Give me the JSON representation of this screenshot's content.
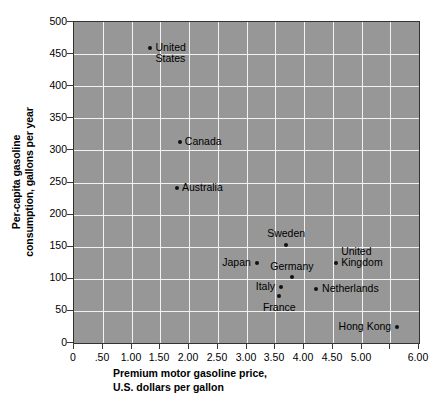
{
  "chart_data": {
    "type": "scatter",
    "title": "",
    "xlabel": "Premium motor gasoline price,\nU.S. dollars per gallon",
    "xlabel_line1": "Premium motor gasoline price,",
    "xlabel_line2": "U.S. dollars per gallon",
    "ylabel": "Per-capita gasoline\nconsumption, gallons per year",
    "ylabel_line1": "Per-capita gasoline",
    "ylabel_line2": "consumption, gallons per year",
    "xlim": [
      0,
      6.0
    ],
    "ylim": [
      0,
      500
    ],
    "xticks": [
      0,
      0.5,
      1.0,
      1.5,
      2.0,
      2.5,
      3.0,
      3.5,
      4.0,
      4.5,
      5.0,
      6.0
    ],
    "xtick_labels": [
      "0",
      ".50",
      "1.00",
      "1.50",
      "2.00",
      "2.50",
      "3.00",
      "3.50",
      "4.00",
      "4.50",
      "5.00",
      "6.00"
    ],
    "xticks_plot": [
      0,
      0.5,
      1.0,
      1.5,
      2.0,
      2.5,
      3.0,
      3.5,
      4.0,
      4.5,
      5.0,
      5.5,
      6.0
    ],
    "yticks": [
      0,
      50,
      100,
      150,
      200,
      250,
      300,
      350,
      400,
      450,
      500
    ],
    "ytick_labels": [
      "0",
      "50",
      "100",
      "150",
      "200",
      "250",
      "300",
      "350",
      "400",
      "450",
      "500"
    ],
    "grid": true,
    "grid_color": "#f2f2f2",
    "plot_background": "#979797",
    "marker_color": "#111111",
    "legend": "none",
    "points": [
      {
        "name": "United States",
        "label_line1": "United",
        "label_line2": "States",
        "x": 1.33,
        "y": 460,
        "label_side": "right",
        "label_dx": 5,
        "label_dy": -6
      },
      {
        "name": "Canada",
        "label_line1": "Canada",
        "label_line2": "",
        "x": 1.84,
        "y": 313,
        "label_side": "right",
        "label_dx": 5,
        "label_dy": -6
      },
      {
        "name": "Australia",
        "label_line1": "Australia",
        "label_line2": "",
        "x": 1.79,
        "y": 241,
        "label_side": "right",
        "label_dx": 5,
        "label_dy": -6
      },
      {
        "name": "Sweden",
        "label_line1": "Sweden",
        "label_line2": "",
        "x": 3.69,
        "y": 153,
        "label_side": "center-above",
        "label_dx": 0,
        "label_dy": -17
      },
      {
        "name": "Japan",
        "label_line1": "Japan",
        "label_line2": "",
        "x": 3.18,
        "y": 125,
        "label_side": "left",
        "label_dx": -6,
        "label_dy": -6
      },
      {
        "name": "Germany",
        "label_line1": "Germany",
        "label_line2": "",
        "x": 3.79,
        "y": 103,
        "label_side": "center-above",
        "label_dx": 0,
        "label_dy": -16
      },
      {
        "name": "Italy",
        "label_line1": "Italy",
        "label_line2": "",
        "x": 3.6,
        "y": 87,
        "label_side": "left",
        "label_dx": -6,
        "label_dy": -6
      },
      {
        "name": "France",
        "label_line1": "France",
        "label_line2": "",
        "x": 3.57,
        "y": 73,
        "label_side": "center-below",
        "label_dx": 0,
        "label_dy": 6
      },
      {
        "name": "Netherlands",
        "label_line1": "Netherlands",
        "label_line2": "",
        "x": 4.21,
        "y": 84,
        "label_side": "right",
        "label_dx": 6,
        "label_dy": -6
      },
      {
        "name": "United Kingdom",
        "label_line1": "United",
        "label_line2": "Kingdom",
        "x": 4.56,
        "y": 125,
        "label_side": "right",
        "label_dx": 5,
        "label_dy": -17
      },
      {
        "name": "Hong Kong",
        "label_line1": "Hong Kong",
        "label_line2": "",
        "x": 5.62,
        "y": 25,
        "label_side": "left",
        "label_dx": -6,
        "label_dy": -6
      }
    ]
  }
}
